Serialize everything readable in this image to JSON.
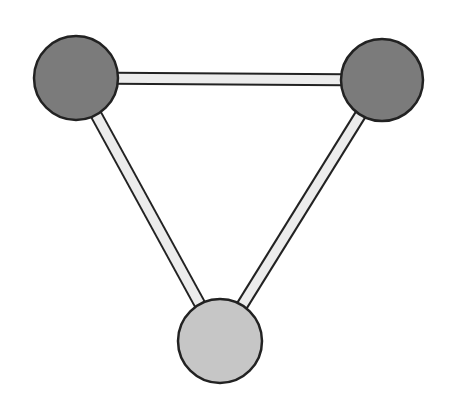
{
  "diagram": {
    "type": "graph",
    "shape": "triangle",
    "background": "#ffffff",
    "outline_color": "#222222",
    "edge_fill_color": "#ececec",
    "nodes": [
      {
        "id": "top-left",
        "cx": 76,
        "cy": 78,
        "r": 42,
        "fill": "#7b7b7b"
      },
      {
        "id": "top-right",
        "cx": 382,
        "cy": 80,
        "r": 41,
        "fill": "#7b7b7b"
      },
      {
        "id": "bottom",
        "cx": 220,
        "cy": 341,
        "r": 42,
        "fill": "#c6c6c6"
      }
    ],
    "edges": [
      {
        "from": "top-left",
        "to": "top-right"
      },
      {
        "from": "top-left",
        "to": "bottom"
      },
      {
        "from": "top-right",
        "to": "bottom"
      }
    ]
  }
}
